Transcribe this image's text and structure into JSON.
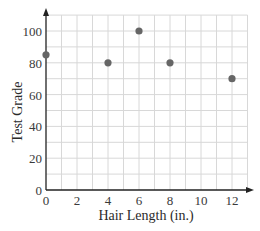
{
  "chart_data": {
    "type": "scatter",
    "title": "",
    "xlabel": "Hair Length (in.)",
    "ylabel": "Test Grade",
    "x": [
      0,
      4,
      6,
      8,
      12
    ],
    "y": [
      85,
      80,
      100,
      80,
      70
    ],
    "series": [
      {
        "name": "Students",
        "points": [
          [
            0,
            85
          ],
          [
            4,
            80
          ],
          [
            6,
            100
          ],
          [
            8,
            80
          ],
          [
            12,
            70
          ]
        ]
      }
    ],
    "xticks": [
      "0",
      "2",
      "4",
      "6",
      "8",
      "10",
      "12"
    ],
    "yticks": [
      "0",
      "20",
      "40",
      "60",
      "80",
      "100"
    ],
    "xlim": [
      0,
      13
    ],
    "ylim": [
      0,
      110
    ],
    "grid": true,
    "grid_minor_x": 1,
    "grid_minor_y": 10,
    "legend": "none",
    "colors": {
      "point": "#666666",
      "grid": "#d8d8d8",
      "axis": "#222222"
    }
  }
}
